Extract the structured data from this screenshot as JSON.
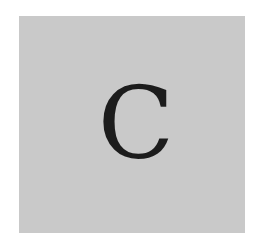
{
  "card": {
    "letter": "C",
    "background_color": "#c9c9c9",
    "letter_color": "#1c1c1c"
  }
}
